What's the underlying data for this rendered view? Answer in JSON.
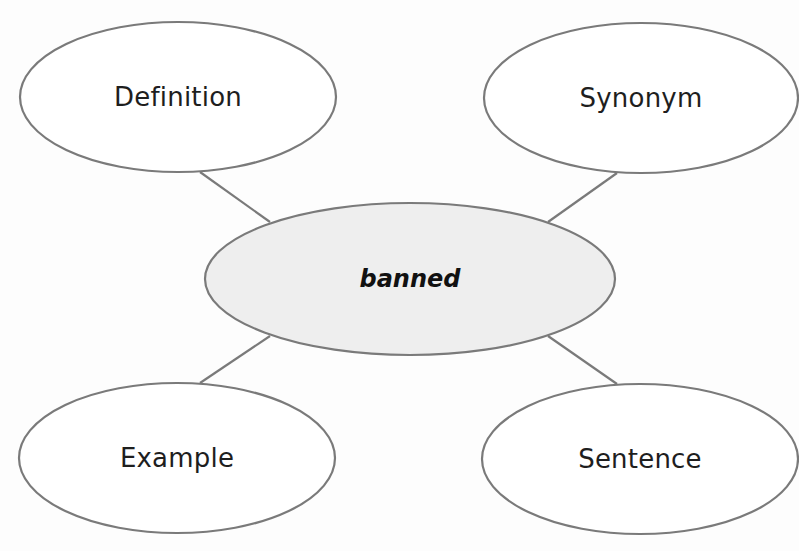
{
  "diagram": {
    "type": "word-map",
    "colors": {
      "stroke": "#7a7a7a",
      "center_fill": "#eeeeee",
      "outer_fill": "#ffffff",
      "text": "#1e1e1e"
    },
    "center": {
      "label": "banned"
    },
    "nodes": [
      {
        "id": "definition",
        "label": "Definition"
      },
      {
        "id": "synonym",
        "label": "Synonym"
      },
      {
        "id": "example",
        "label": "Example"
      },
      {
        "id": "sentence",
        "label": "Sentence"
      }
    ]
  }
}
